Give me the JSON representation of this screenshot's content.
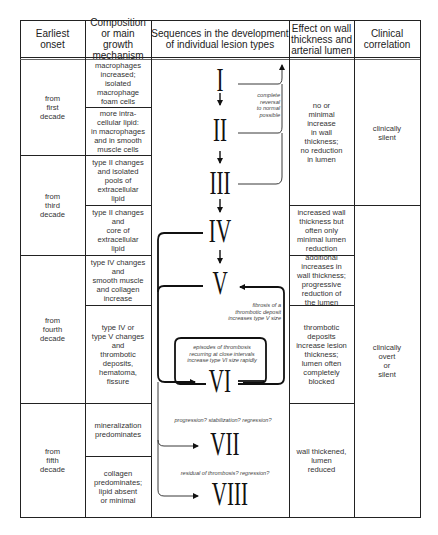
{
  "headers": {
    "onset": "Earliest\nonset",
    "composition": "Composition\nor main growth\nmechanism",
    "sequences": "Sequences in the development\nof individual lesion types",
    "effect": "Effect on wall\nthickness and\narterial lumen",
    "clinical": "Clinical\ncorrelation"
  },
  "onset": [
    "from\nfirst\ndecade",
    "from\nthird\ndecade",
    "from\nfourth\ndecade",
    "from\nfifth\ndecade"
  ],
  "composition": [
    "macrophages\nincreased;\nisolated\nmacrophage\nfoam cells",
    "more intra-\ncellular lipid:\nin macrophages\nand in smooth\nmuscle cells",
    "type II changes\nand isolated\npools of\nextracellular\nlipid",
    "type II changes\nand\ncore of\nextracellular\nlipid",
    "type IV changes\nand\nsmooth muscle\nand collagen\nincrease",
    "type IV or\ntype V changes\nand\nthrombotic\ndeposits,\nhematoma,\nfissure",
    "mineralization\npredominates",
    "collagen\npredominates;\nlipid absent\nor minimal"
  ],
  "lesion_types": [
    "I",
    "II",
    "III",
    "IV",
    "V",
    "VI",
    "VII",
    "VIII"
  ],
  "notes": {
    "reversal": "complete\nreversal\nto normal\npossible",
    "fibrosis": "fibrosis of a\nthrombotic deposit\nincreases type V size",
    "episodes": "episodes of thrombosis\nrecurring at close intervals\nincrease type VI size rapidly",
    "progression": "progression? stabilization? regression?",
    "residual": "residual of thrombosis? regression?"
  },
  "effect": [
    "no or\nminimal\nincrease\nin wall\nthickness;\nno reduction\nin lumen",
    "increased wall\nthickness but\noften only\nminimal lumen\nreduction",
    "additional\nincreases in\nwall thickness;\nprogressive\nreduction of\nthe lumen",
    "thrombotic\ndeposits\nincrease lesion\nthickness;\nlumen often\ncompletely\nblocked",
    "wall thickened,\nlumen\nreduced"
  ],
  "clinical": [
    "clinically\nsilent",
    "clinically\novert\nor\nsilent"
  ]
}
